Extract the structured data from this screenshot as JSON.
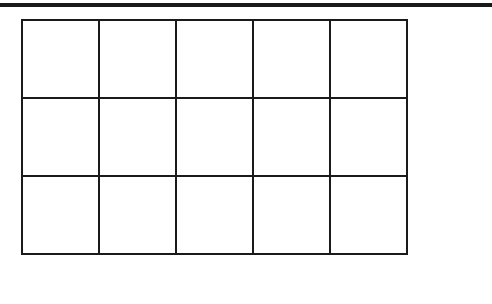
{
  "diagram": {
    "type": "empty-grid",
    "rows": 3,
    "columns": 5,
    "line_color": "#1a1a1a",
    "background": "#ffffff",
    "cells": [
      [
        "",
        "",
        "",
        "",
        ""
      ],
      [
        "",
        "",
        "",
        "",
        ""
      ],
      [
        "",
        "",
        "",
        "",
        ""
      ]
    ]
  }
}
